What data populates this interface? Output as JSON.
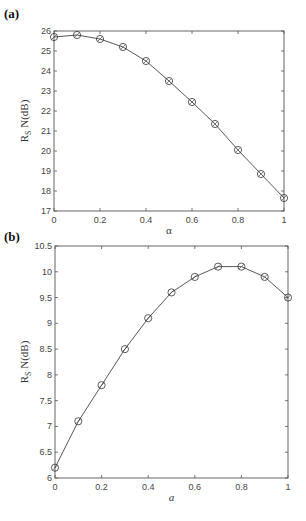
{
  "chart_data": [
    {
      "type": "line",
      "panel_label": "(a)",
      "title": "",
      "xlabel": "α",
      "ylabel": "R_S N(dB)",
      "x": [
        0,
        0.1,
        0.2,
        0.3,
        0.4,
        0.5,
        0.6,
        0.7,
        0.8,
        0.9,
        1.0
      ],
      "series": [
        {
          "name": "RSN",
          "values": [
            25.7,
            25.8,
            25.6,
            25.2,
            24.5,
            23.5,
            22.45,
            21.35,
            20.05,
            18.85,
            17.65
          ],
          "marker": "circle"
        }
      ],
      "xlim": [
        0,
        1
      ],
      "ylim": [
        17,
        26
      ],
      "xticks": [
        "0",
        "0.2",
        "0.4",
        "0.6",
        "0.8",
        "1"
      ],
      "yticks": [
        "17",
        "18",
        "19",
        "20",
        "21",
        "22",
        "23",
        "24",
        "25",
        "26"
      ],
      "grid": false
    },
    {
      "type": "line",
      "panel_label": "(b)",
      "title": "",
      "xlabel": "a",
      "ylabel": "R_S N(dB)",
      "x": [
        0,
        0.1,
        0.2,
        0.3,
        0.4,
        0.5,
        0.6,
        0.7,
        0.8,
        0.9,
        1.0
      ],
      "series": [
        {
          "name": "RSN",
          "values": [
            6.2,
            7.1,
            7.8,
            8.5,
            9.1,
            9.6,
            9.9,
            10.1,
            10.1,
            9.9,
            9.5
          ],
          "marker": "circle"
        }
      ],
      "xlim": [
        0,
        1
      ],
      "ylim": [
        6,
        10.5
      ],
      "xticks": [
        "0",
        "0.2",
        "0.4",
        "0.6",
        "0.8",
        "1"
      ],
      "yticks": [
        "6",
        "6.5",
        "7",
        "7.5",
        "8",
        "8.5",
        "9",
        "9.5",
        "10",
        "10.5"
      ],
      "grid": false
    }
  ]
}
